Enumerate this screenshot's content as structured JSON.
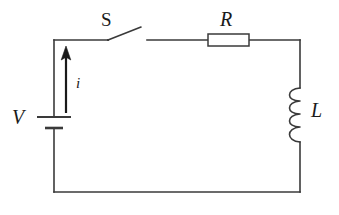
{
  "diagram": {
    "type": "electrical-circuit-schematic",
    "background_color": "#ffffff",
    "line_color": "#3a3a3a",
    "label_color": "#1a1a1a"
  },
  "labels": {
    "source": "V",
    "current": "i",
    "switch": "S",
    "resistor": "R",
    "inductor": "L"
  },
  "components": [
    {
      "name": "voltage-source",
      "symbol": "battery",
      "label": "V",
      "position": "left-branch",
      "orientation": "vertical",
      "plates": [
        {
          "type": "positive",
          "length_px": 34,
          "y": 117
        },
        {
          "type": "negative",
          "length_px": 18,
          "y": 128
        }
      ]
    },
    {
      "name": "switch",
      "symbol": "spst-switch-open",
      "label": "S",
      "position": "top-branch",
      "state": "open",
      "pivot": {
        "x": 108,
        "y": 40
      },
      "blade_tip": {
        "x": 141,
        "y": 27
      },
      "right_contact": {
        "x": 147,
        "y": 40
      }
    },
    {
      "name": "resistor",
      "symbol": "resistor-box",
      "label": "R",
      "position": "top-branch",
      "orientation": "horizontal",
      "box": {
        "x": 208,
        "y": 34,
        "width": 41,
        "height": 12
      }
    },
    {
      "name": "inductor",
      "symbol": "coil",
      "label": "L",
      "position": "right-branch",
      "orientation": "vertical",
      "turns": 4,
      "bump_direction": "left",
      "span": {
        "y_top": 88,
        "y_bottom": 142
      }
    },
    {
      "name": "current-arrow",
      "symbol": "arrow-up",
      "label": "i",
      "position": "left-branch",
      "direction": "up",
      "tail": {
        "x": 66,
        "y": 113
      },
      "head": {
        "x": 66,
        "y": 47
      }
    }
  ],
  "loop": {
    "name": "circuit-loop",
    "corners": {
      "top_left": {
        "x": 54,
        "y": 40
      },
      "top_right": {
        "x": 300,
        "y": 40
      },
      "bottom_right": {
        "x": 300,
        "y": 192
      },
      "bottom_left": {
        "x": 54,
        "y": 192
      }
    }
  }
}
